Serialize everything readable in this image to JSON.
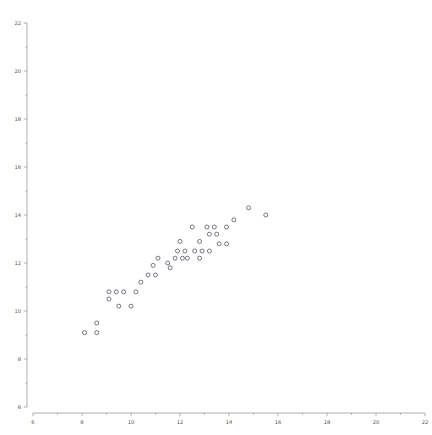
{
  "chart_data": {
    "type": "scatter",
    "title": "",
    "subtitle": "",
    "xlabel": "",
    "ylabel": "",
    "xlim": [
      6,
      22
    ],
    "ylim": [
      6,
      22
    ],
    "xticks": [
      6,
      8,
      10,
      12,
      14,
      16,
      18,
      20,
      22
    ],
    "yticks": [
      6,
      8,
      10,
      12,
      14,
      16,
      18,
      20,
      22
    ],
    "xticklabels": [
      "6",
      "8",
      "10",
      "12",
      "14",
      "16",
      "18",
      "20",
      "22"
    ],
    "yticklabels": [
      "6",
      "8",
      "10",
      "12",
      "14",
      "16",
      "18",
      "20",
      "22"
    ],
    "minor_tick_step": 1,
    "grid": false,
    "legend": null,
    "legend_position": "none",
    "marker": "open-circle",
    "marker_size": 4,
    "marker_color": "#5f5f6d",
    "axis_color": "#9a9a9a",
    "label_color": "#555555",
    "background_color": "#ffffff",
    "spines": "detached",
    "series": [
      {
        "name": "points",
        "points": [
          [
            8.1,
            9.1
          ],
          [
            8.6,
            9.5
          ],
          [
            8.6,
            9.1
          ],
          [
            9.5,
            10.2
          ],
          [
            10.0,
            10.2
          ],
          [
            9.1,
            10.8
          ],
          [
            9.4,
            10.8
          ],
          [
            9.7,
            10.8
          ],
          [
            10.2,
            10.8
          ],
          [
            9.1,
            10.5
          ],
          [
            10.4,
            11.2
          ],
          [
            10.7,
            11.5
          ],
          [
            11.0,
            11.5
          ],
          [
            10.9,
            11.9
          ],
          [
            11.5,
            12.0
          ],
          [
            11.1,
            12.2
          ],
          [
            11.8,
            12.2
          ],
          [
            12.1,
            12.2
          ],
          [
            12.3,
            12.2
          ],
          [
            12.8,
            12.2
          ],
          [
            11.6,
            11.8
          ],
          [
            11.9,
            12.5
          ],
          [
            12.2,
            12.5
          ],
          [
            12.6,
            12.5
          ],
          [
            12.9,
            12.5
          ],
          [
            13.2,
            12.5
          ],
          [
            12.0,
            12.9
          ],
          [
            12.8,
            12.9
          ],
          [
            13.6,
            12.8
          ],
          [
            13.9,
            12.8
          ],
          [
            13.2,
            13.2
          ],
          [
            13.5,
            13.2
          ],
          [
            12.5,
            13.5
          ],
          [
            13.1,
            13.5
          ],
          [
            13.4,
            13.5
          ],
          [
            13.9,
            13.5
          ],
          [
            14.2,
            13.8
          ],
          [
            14.8,
            14.3
          ],
          [
            15.5,
            14.0
          ]
        ]
      }
    ]
  }
}
